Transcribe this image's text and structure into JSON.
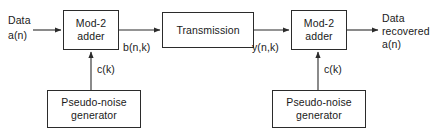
{
  "diagram": {
    "stroke_color": "#2b2b2b",
    "text_color": "#1a1a1a",
    "background_color": "#ffffff",
    "boxes": [
      {
        "id": "adder1",
        "line1": "Mod-2",
        "line2": "adder"
      },
      {
        "id": "transmission",
        "line1": "Transmission",
        "line2": ""
      },
      {
        "id": "adder2",
        "line1": "Mod-2",
        "line2": "adder"
      },
      {
        "id": "png1",
        "line1": "Pseudo-noise",
        "line2": "generator"
      },
      {
        "id": "png2",
        "line1": "Pseudo-noise",
        "line2": "generator"
      }
    ],
    "labels": {
      "data_in_line1": "Data",
      "data_in_line2": "a(n)",
      "signal_b": "b(n,k)",
      "signal_y": "y(n,k)",
      "code_left": "c(k)",
      "code_right": "c(k)",
      "data_out_line1": "Data",
      "data_out_line2": "recovered",
      "data_out_line3": "a(n)"
    },
    "connections": [
      {
        "from": "data-input",
        "to": "adder1",
        "direction": "right",
        "arrow": true
      },
      {
        "from": "adder1",
        "to": "transmission",
        "direction": "right",
        "arrow": true,
        "label": "b(n,k)"
      },
      {
        "from": "transmission",
        "to": "adder2",
        "direction": "right",
        "arrow": true,
        "label": "y(n,k)"
      },
      {
        "from": "adder2",
        "to": "data-output",
        "direction": "right",
        "arrow": true
      },
      {
        "from": "png1",
        "to": "adder1",
        "direction": "up",
        "arrow": true,
        "label": "c(k)"
      },
      {
        "from": "png2",
        "to": "adder2",
        "direction": "up",
        "arrow": true,
        "label": "c(k)"
      }
    ]
  }
}
